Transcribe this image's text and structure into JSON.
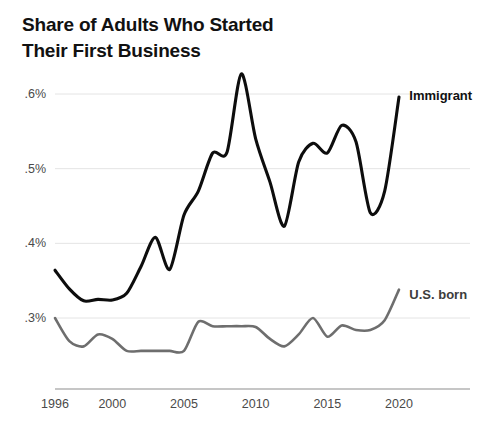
{
  "header": {
    "title_line_1": "Share of Adults Who Started",
    "title_line_2": "Their First Business"
  },
  "chart_data": {
    "type": "line",
    "title": "Share of Adults Who Started Their First Business",
    "xlabel": "",
    "ylabel": "",
    "grid": true,
    "legend_position": "inline-right",
    "xlim": [
      1996,
      2020
    ],
    "ylim": [
      0.24,
      0.64
    ],
    "x_ticks": [
      "1996",
      "2000",
      "2005",
      "2010",
      "2015",
      "2020"
    ],
    "x_tick_values": [
      1996,
      2000,
      2005,
      2010,
      2015,
      2020
    ],
    "y_ticks": [
      ".3%",
      ".4%",
      ".5%",
      ".6%"
    ],
    "y_tick_values": [
      0.3,
      0.4,
      0.5,
      0.6
    ],
    "x": [
      1996,
      1997,
      1998,
      1999,
      2000,
      2001,
      2002,
      2003,
      2004,
      2005,
      2006,
      2007,
      2008,
      2009,
      2010,
      2011,
      2012,
      2013,
      2014,
      2015,
      2016,
      2017,
      2018,
      2019,
      2020
    ],
    "series": [
      {
        "name": "Immigrant",
        "color": "#0d0d0d",
        "label_x": 2020.3,
        "label_y": 0.597,
        "values": [
          0.364,
          0.339,
          0.323,
          0.325,
          0.324,
          0.333,
          0.369,
          0.408,
          0.365,
          0.438,
          0.47,
          0.521,
          0.522,
          0.627,
          0.54,
          0.482,
          0.423,
          0.509,
          0.534,
          0.521,
          0.558,
          0.536,
          0.441,
          0.47,
          0.596
        ]
      },
      {
        "name": "U.S. born",
        "color": "#6e6e6e",
        "label_x": 2020.3,
        "label_y": 0.33,
        "values": [
          0.3,
          0.269,
          0.262,
          0.278,
          0.272,
          0.256,
          0.256,
          0.256,
          0.256,
          0.256,
          0.295,
          0.289,
          0.289,
          0.289,
          0.288,
          0.272,
          0.262,
          0.278,
          0.3,
          0.275,
          0.29,
          0.284,
          0.284,
          0.297,
          0.338
        ]
      }
    ]
  },
  "labels": {
    "immigrant": "Immigrant",
    "us_born": "U.S. born"
  }
}
